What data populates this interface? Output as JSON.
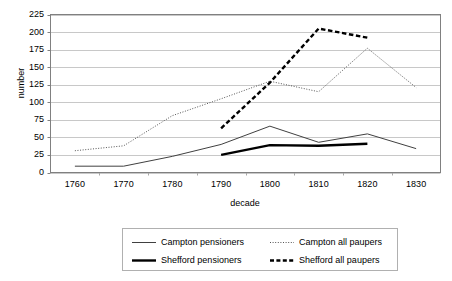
{
  "chart_data": {
    "type": "line",
    "title": "",
    "xlabel": "decade",
    "ylabel": "number",
    "x": [
      1760,
      1770,
      1780,
      1790,
      1800,
      1810,
      1820,
      1830
    ],
    "xtick_labels": [
      "1760",
      "1770",
      "1780",
      "1790",
      "1800",
      "1810",
      "1820",
      "1830"
    ],
    "ytick_labels": [
      "0",
      "25",
      "50",
      "75",
      "100",
      "125",
      "150",
      "175",
      "200",
      "225"
    ],
    "ylim": [
      0,
      225
    ],
    "ytick_step": 25,
    "grid": "horizontal",
    "legend_position": "bottom",
    "series": [
      {
        "name": "Campton pensioners",
        "style": "thin-solid",
        "color": "#404040",
        "x": [
          1760,
          1770,
          1780,
          1790,
          1800,
          1810,
          1820,
          1830
        ],
        "values": [
          9,
          9,
          23,
          40,
          66,
          43,
          55,
          34
        ]
      },
      {
        "name": "Campton all paupers",
        "style": "fine-dotted",
        "color": "#555555",
        "x": [
          1760,
          1770,
          1780,
          1790,
          1800,
          1810,
          1820,
          1830
        ],
        "values": [
          31,
          38,
          81,
          105,
          130,
          115,
          177,
          121
        ]
      },
      {
        "name": "Shefford pensioners",
        "style": "thick-solid",
        "color": "#000000",
        "x": [
          1790,
          1800,
          1810,
          1820
        ],
        "values": [
          25,
          39,
          38,
          41
        ]
      },
      {
        "name": "Shefford all paupers",
        "style": "thick-dashed",
        "color": "#000000",
        "x": [
          1790,
          1800,
          1810,
          1820
        ],
        "values": [
          63,
          128,
          205,
          192
        ]
      }
    ]
  },
  "legend": {
    "items": [
      {
        "label": "Campton pensioners",
        "style": "thin-solid"
      },
      {
        "label": "Campton all paupers",
        "style": "fine-dotted"
      },
      {
        "label": "Shefford pensioners",
        "style": "thick-solid"
      },
      {
        "label": "Shefford all paupers",
        "style": "thick-dashed"
      }
    ]
  },
  "colors": {
    "plot_border": "#808080",
    "gridline": "#c8c8c8",
    "axis_text": "#000000",
    "legend_border": "#b0b0b0",
    "background": "#ffffff"
  }
}
